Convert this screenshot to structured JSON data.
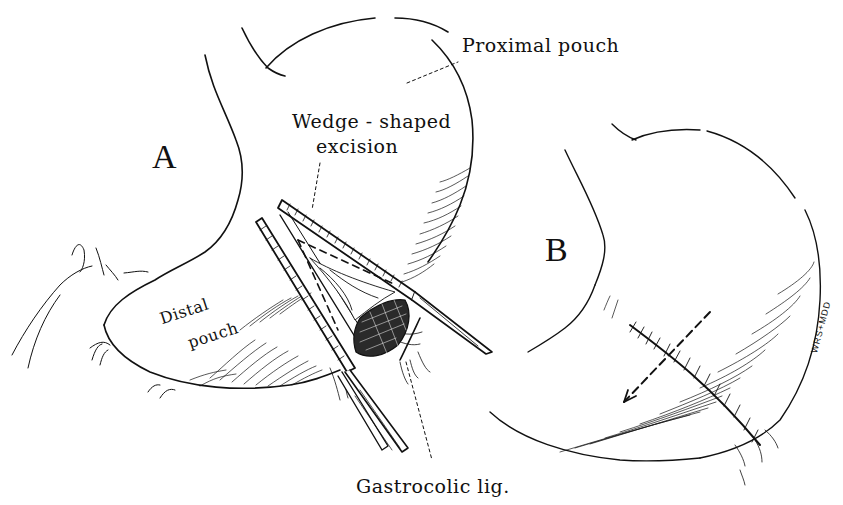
{
  "figure": {
    "type": "medical line illustration",
    "colors": {
      "ink": "#111111",
      "paper": "#ffffff"
    },
    "panels": [
      {
        "id": "A",
        "letter": "A",
        "labels": {
          "proximal_pouch": "Proximal pouch",
          "wedge_line1": "Wedge - shaped",
          "wedge_line2": "excision",
          "distal_line1": "Distal",
          "distal_line2": "pouch",
          "gastrocolic": "Gastrocolic lig."
        }
      },
      {
        "id": "B",
        "letter": "B",
        "signature": "WRS+MDD"
      }
    ]
  }
}
